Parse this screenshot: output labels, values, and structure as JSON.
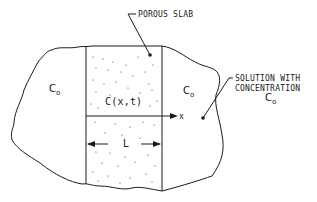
{
  "diagram": {
    "labels": {
      "porous_slab": "POROUS SLAB",
      "solution_line1": "SOLUTION WITH",
      "solution_line2": "CONCENTRATION",
      "solution_c": "C",
      "solution_c_sub": "o",
      "left_c": "C",
      "left_c_sub": "o",
      "right_c": "C",
      "right_c_sub": "o",
      "slab_concentration": "C(x,t)",
      "x_axis": "x",
      "thickness": "L"
    },
    "colors": {
      "line": "#1a1a1a",
      "background": "#ffffff"
    }
  }
}
